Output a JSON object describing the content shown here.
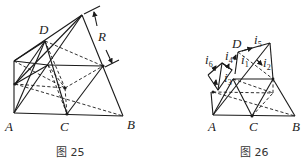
{
  "figure25": {
    "caption": "图 25",
    "labels": {
      "A": "A",
      "B": "B",
      "C": "C",
      "D": "D",
      "R": "R"
    },
    "description": "Tetrahedral wire-frame network of resistors; R marks spacing between parallel planes"
  },
  "figure26": {
    "caption": "图 26",
    "labels": {
      "A": "A",
      "B": "B",
      "C": "C",
      "D": "D"
    },
    "currents": [
      {
        "id": "i1",
        "label": "i",
        "sub": "1"
      },
      {
        "id": "i2",
        "label": "i",
        "sub": "2"
      },
      {
        "id": "i3",
        "label": "i",
        "sub": "3"
      },
      {
        "id": "i4",
        "label": "i",
        "sub": "4"
      },
      {
        "id": "i5",
        "label": "i",
        "sub": "5"
      },
      {
        "id": "i6",
        "label": "i",
        "sub": "6"
      }
    ]
  }
}
